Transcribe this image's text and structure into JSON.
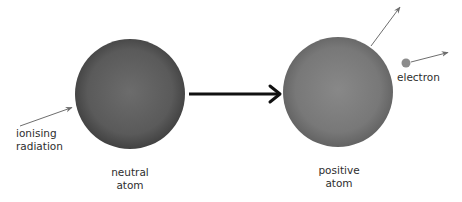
{
  "diagram": {
    "colors": {
      "neutral_atom_center": "#6a6a6a",
      "neutral_atom_edge": "#3e3e3e",
      "positive_atom_center": "#858585",
      "positive_atom_edge": "#5c5c5c",
      "electron": "#8c8c8c",
      "main_arrow": "#111111",
      "thin_arrow": "#6e6e6e",
      "text": "#2e2e2e"
    },
    "labels": {
      "ionising_radiation": {
        "line1": "ionising",
        "line2": "radiation"
      },
      "neutral_atom": {
        "line1": "neutral",
        "line2": "atom"
      },
      "positive_atom": {
        "line1": "positive",
        "line2": "atom"
      },
      "electron": "electron"
    },
    "nodes": [
      {
        "id": "neutral-atom",
        "cx": 130,
        "cy": 94,
        "r": 55
      },
      {
        "id": "positive-atom",
        "cx": 338,
        "cy": 92,
        "r": 55
      },
      {
        "id": "electron",
        "cx": 406,
        "cy": 63,
        "r": 4.5
      }
    ],
    "arrows": [
      {
        "id": "radiation-arrow",
        "from": [
          20,
          126
        ],
        "to": [
          73,
          107
        ]
      },
      {
        "id": "process-arrow",
        "from": [
          189,
          94
        ],
        "to": [
          280,
          94
        ]
      },
      {
        "id": "radiation-exit-arrow",
        "from": [
          371,
          46
        ],
        "to": [
          401,
          6
        ]
      },
      {
        "id": "electron-arrow",
        "from": [
          411,
          62
        ],
        "to": [
          449,
          52
        ]
      }
    ]
  }
}
